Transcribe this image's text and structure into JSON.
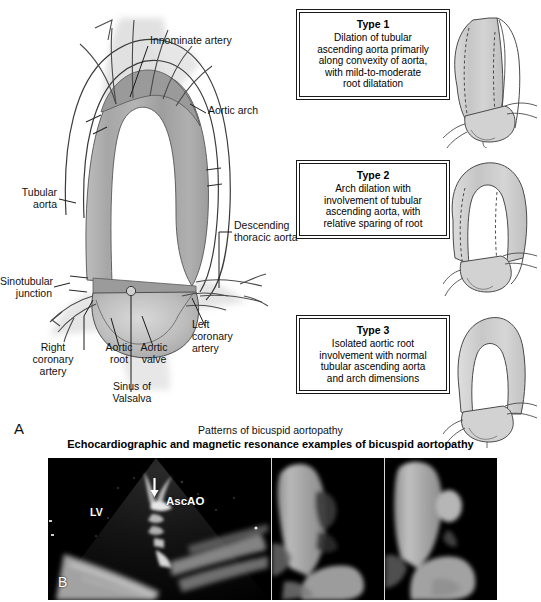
{
  "figure": {
    "panel_a_letter": "A",
    "panel_b_letter": "B",
    "caption_patterns": "Patterns of bicuspid aortopathy",
    "caption_echo": "Echocardiographic and magnetic resonance examples of bicuspid aortopathy"
  },
  "anatomy_labels": {
    "innominate_artery": "Innominate artery",
    "aortic_arch": "Aortic arch",
    "tubular_aorta": "Tubular\naorta",
    "descending_thoracic_aorta": "Descending\nthoracic aorta",
    "sinotubular_junction": "Sinotubular\njunction",
    "right_coronary_artery": "Right\ncoronary\nartery",
    "aortic_root": "Aortic\nroot",
    "aortic_valve": "Aortic\nvalve",
    "sinus_of_valsalva": "Sinus of\nValsalva",
    "left_coronary_artery": "Left\ncoronary\nartery"
  },
  "types": [
    {
      "title": "Type 1",
      "body": "Dilation of tubular\nascending aorta primarily\nalong convexity of aorta,\nwith mild-to-moderate\nroot dilatation"
    },
    {
      "title": "Type 2",
      "body": "Arch dilation with\ninvolvement of tubular\nascending aorta, with\nrelative sparing of root"
    },
    {
      "title": "Type 3",
      "body": "Isolated aortic root\ninvolvement with normal\ntubular ascending aorta\nand arch dimensions"
    }
  ],
  "image_annotations": {
    "lv": "LV",
    "ascao": "AscAO",
    "arrow": "arrow-icon"
  },
  "colors": {
    "vessel_fill": "#a9a9a9",
    "vessel_fill_light": "#cfcfcf",
    "outline": "#3b3b3b",
    "box_border": "#1a1a1a",
    "background": "#ffffff",
    "image_background": "#000000"
  }
}
